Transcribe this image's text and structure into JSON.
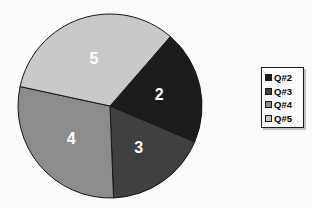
{
  "page": {
    "background_color": "#fbfbfb"
  },
  "chart_data": {
    "type": "pie",
    "title": "",
    "categories": [
      "Q#2",
      "Q#3",
      "Q#4",
      "Q#5"
    ],
    "values": [
      20,
      18,
      29,
      33
    ],
    "slice_labels": [
      "2",
      "3",
      "4",
      "5"
    ],
    "colors": [
      "#1c1c1c",
      "#404040",
      "#8c8c8c",
      "#c9c9c9"
    ],
    "outline_color": "#151515",
    "slice_label_color": "#ffffff",
    "start_angle_deg": 41,
    "legend_position": "right",
    "legend": [
      {
        "label": "Q#2",
        "color": "#1c1c1c"
      },
      {
        "label": "Q#3",
        "color": "#404040"
      },
      {
        "label": "Q#4",
        "color": "#8c8c8c"
      },
      {
        "label": "Q#5",
        "color": "#c9c9c9"
      }
    ]
  }
}
